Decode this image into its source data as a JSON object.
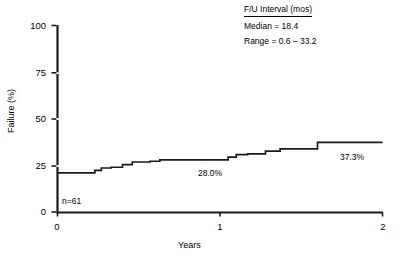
{
  "chart_data": {
    "type": "line",
    "title": "",
    "xlabel": "Years",
    "ylabel": "Failure (%)",
    "xlim": [
      0,
      2
    ],
    "ylim": [
      0,
      100
    ],
    "xticks": [
      "0",
      "1",
      "2"
    ],
    "xtick_values": [
      0,
      1,
      2
    ],
    "yticks": [
      "0",
      "25",
      "50",
      "75",
      "100"
    ],
    "ytick_values": [
      0,
      25,
      50,
      75,
      100
    ],
    "grid": false,
    "legend_position": "top-right",
    "step_style": "post",
    "series": [
      {
        "name": "Cumulative failure",
        "x": [
          0.0,
          0.23,
          0.27,
          0.33,
          0.4,
          0.46,
          0.57,
          0.63,
          0.78,
          1.05,
          1.1,
          1.17,
          1.28,
          1.37,
          1.6,
          2.0
        ],
        "values": [
          21.0,
          22.3,
          23.6,
          24.0,
          25.4,
          26.8,
          27.2,
          28.0,
          28.0,
          29.4,
          30.8,
          31.2,
          32.6,
          33.9,
          37.3,
          37.3
        ]
      }
    ],
    "annotations": [
      {
        "name": "sample-size",
        "text": "n=61",
        "x": 0.04,
        "y": 7.5
      },
      {
        "name": "midpoint-value",
        "text": "28.0%",
        "x": 0.87,
        "y": 22.0
      },
      {
        "name": "endpoint-value",
        "text": "37.3%",
        "x": 1.74,
        "y": 30.5
      }
    ]
  },
  "legend": {
    "title": "F/U Interval (mos)",
    "rows": [
      "Median = 18.4",
      "Range = 0.6 – 33.2"
    ]
  },
  "axes": {
    "xlabel": "Years",
    "ylabel": "Failure (%)"
  },
  "colors": {
    "line": "#1a1a1a",
    "axis": "#1a1a1a",
    "background": "#ffffff"
  }
}
